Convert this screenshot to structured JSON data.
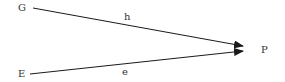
{
  "diagram": {
    "nodes": [
      {
        "id": "G",
        "label": "G",
        "x": 18,
        "y": 3
      },
      {
        "id": "E",
        "label": "E",
        "x": 18,
        "y": 69
      },
      {
        "id": "P",
        "label": "P",
        "x": 261,
        "y": 45
      }
    ],
    "edges": [
      {
        "from": "G",
        "to": "P",
        "label": "h",
        "label_x": 124,
        "label_y": 12
      },
      {
        "from": "E",
        "to": "P",
        "label": "e",
        "label_x": 122,
        "label_y": 67
      }
    ],
    "colors": {
      "line": "#1a1a1a",
      "text": "#333333"
    }
  }
}
